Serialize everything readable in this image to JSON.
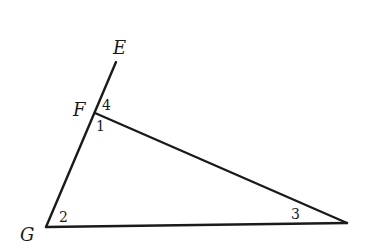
{
  "figure": {
    "type": "geometry-triangle-with-extended-side",
    "points": {
      "E": {
        "label": "E",
        "x": 116,
        "y": 62
      },
      "F": {
        "label": "F",
        "x": 95,
        "y": 113
      },
      "G": {
        "label": "G",
        "x": 46,
        "y": 227
      },
      "H": {
        "label": "",
        "x": 347,
        "y": 223
      }
    },
    "segments": [
      {
        "from": "G",
        "to": "E",
        "name": "ray-GE"
      },
      {
        "from": "F",
        "to": "H",
        "name": "segment-FH"
      },
      {
        "from": "G",
        "to": "H",
        "name": "segment-GH"
      }
    ],
    "vertex_labels": {
      "E": "E",
      "F": "F",
      "G": "G"
    },
    "angle_labels": {
      "a1": "1",
      "a2": "2",
      "a3": "3",
      "a4": "4"
    },
    "colors": {
      "line": "#1a1a1a",
      "background": "#ffffff"
    }
  }
}
